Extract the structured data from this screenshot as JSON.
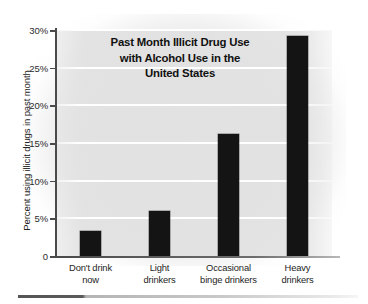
{
  "chart_data": {
    "type": "bar",
    "title_lines": [
      "Past Month Illicit Drug Use",
      "with Alcohol Use in the",
      "United States"
    ],
    "xlabel": "",
    "ylabel": "Percent using illicit drugs in past month",
    "categories": [
      "Don't drink now",
      "Light drinkers",
      "Occasional binge drinkers",
      "Heavy drinkers"
    ],
    "category_lines": [
      [
        "Don't drink",
        "now"
      ],
      [
        "Light",
        "drinkers"
      ],
      [
        "Occasional",
        "binge drinkers"
      ],
      [
        "Heavy",
        "drinkers"
      ]
    ],
    "values": [
      3.3,
      6.0,
      16.2,
      29.2
    ],
    "ylim": [
      0,
      30
    ],
    "ytick_values": [
      0,
      5,
      10,
      15,
      20,
      25,
      30
    ],
    "ytick_labels": [
      "0",
      "5%",
      "10%",
      "15%",
      "20%",
      "25%",
      "30%"
    ],
    "grid": true,
    "legend": "none",
    "bar_color": "#141414",
    "plot_background_color": "#e2e2e2",
    "gridline_color": "#ffffff",
    "axis_color": "#4a4a4a"
  }
}
